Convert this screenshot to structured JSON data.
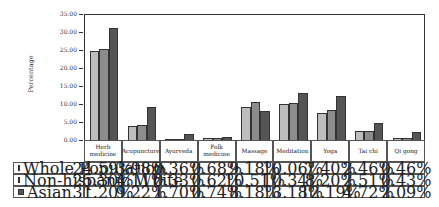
{
  "chart_data": {
    "type": "bar",
    "title": "",
    "xlabel": "",
    "ylabel": "Percentage",
    "ylim": [
      0,
      35
    ],
    "yticks": [
      "0.00",
      "5.00",
      "10.00",
      "15.00",
      "20.00",
      "25.00",
      "30.00",
      "35.00"
    ],
    "grid": false,
    "legend_position": "data-table-below",
    "categories": [
      "Herb\nmedicine",
      "Acupuncture",
      "Ayurveda",
      "Folk\nmedicine",
      "Massage",
      "Meditation",
      "Yoga",
      "Tai chi",
      "Qi gong"
    ],
    "series": [
      {
        "name": "Whole Population",
        "color": "#bdbdbd",
        "values": [
          24.59,
          3.98,
          0.36,
          0.68,
          9.18,
          10.06,
          7.4,
          2.46,
          0.46
        ],
        "labels": [
          "24.59%",
          "3.98%",
          "0.36%",
          "0.68%",
          "9.18%",
          "10.06%",
          "7.40%",
          "2.46%",
          "0.46%"
        ]
      },
      {
        "name": "Non-hispanic White",
        "color": "#8c8c8c",
        "values": [
          25.3,
          4.11,
          0.33,
          0.62,
          10.51,
          10.34,
          8.2,
          2.51,
          0.43
        ],
        "labels": [
          "25.30%",
          "4.11%",
          "0.33%",
          "0.62%",
          "10.51%",
          "10.34%",
          "8.20%",
          "2.51%",
          "0.43%"
        ]
      },
      {
        "name": "Asian",
        "color": "#555555",
        "values": [
          31.2,
          9.22,
          1.7,
          0.74,
          8.18,
          13.18,
          12.19,
          4.72,
          2.09
        ],
        "labels": [
          "31.20%",
          "9.22%",
          "1.70%",
          "0.74%",
          "8.18%",
          "13.18%",
          "12.19%",
          "4.72%",
          "2.09%"
        ]
      }
    ]
  }
}
